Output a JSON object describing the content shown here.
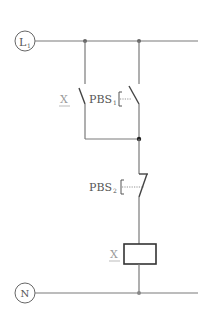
{
  "diagram": {
    "title": "",
    "type": "ladder-control-circuit",
    "terminals": [
      {
        "id": "L1",
        "label": "L",
        "subscript": "1"
      },
      {
        "id": "N",
        "label": "N"
      }
    ],
    "components": [
      {
        "id": "X-contact",
        "label": "X",
        "kind": "normally-open contact (holding)",
        "underline": true
      },
      {
        "id": "PBS1",
        "label": "PBS",
        "subscript": "1",
        "kind": "push button normally-open"
      },
      {
        "id": "PBS2",
        "label": "PBS",
        "subscript": "2",
        "kind": "push button normally-closed"
      },
      {
        "id": "X-coil",
        "label": "X",
        "kind": "relay coil",
        "underline": true
      }
    ],
    "colors": {
      "wire": "#7a7a7a",
      "component": "#444444",
      "label": "#555555",
      "label_x": "#999999"
    }
  }
}
